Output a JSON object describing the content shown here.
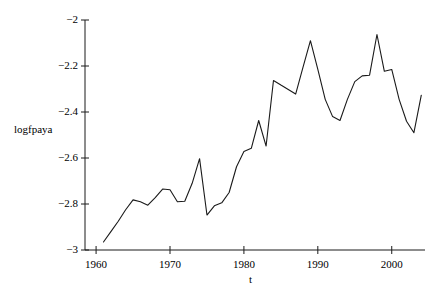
{
  "chart_data": {
    "type": "line",
    "title": "",
    "xlabel": "t",
    "ylabel": "logfpaya",
    "xlim": [
      1958.5,
      2004.5
    ],
    "ylim": [
      -3.02,
      -1.98
    ],
    "grid": false,
    "legend": "none",
    "x_ticks": [
      1960,
      1970,
      1980,
      1990,
      2000
    ],
    "x_tick_labels": [
      "1960",
      "1970",
      "1980",
      "1990",
      "2000"
    ],
    "y_ticks": [
      -2,
      -2.2,
      -2.4,
      -2.6,
      -2.8,
      -3
    ],
    "y_tick_labels": [
      "−2",
      "−2.2",
      "−2.4",
      "−2.6",
      "−2.8",
      "−3"
    ],
    "series": [
      {
        "name": "logfpaya",
        "color": "#1a1a1a",
        "x": [
          1961,
          1962,
          1963,
          1964,
          1965,
          1966,
          1967,
          1968,
          1969,
          1970,
          1971,
          1972,
          1973,
          1974,
          1975,
          1976,
          1977,
          1978,
          1979,
          1980,
          1981,
          1982,
          1983,
          1984,
          1985,
          1986,
          1987,
          1988,
          1989,
          1990,
          1991,
          1992,
          1993,
          1994,
          1995,
          1996,
          1997,
          1998,
          1999,
          2000,
          2001,
          2002,
          2003,
          2004
        ],
        "values": [
          -2.965,
          -2.92,
          -2.875,
          -2.825,
          -2.782,
          -2.79,
          -2.805,
          -2.772,
          -2.735,
          -2.738,
          -2.79,
          -2.788,
          -2.71,
          -2.603,
          -2.848,
          -2.808,
          -2.795,
          -2.75,
          -2.638,
          -2.572,
          -2.558,
          -2.437,
          -2.548,
          -2.263,
          -2.283,
          -2.302,
          -2.322,
          -2.205,
          -2.09,
          -2.215,
          -2.345,
          -2.42,
          -2.437,
          -2.345,
          -2.268,
          -2.243,
          -2.24,
          -2.063,
          -2.223,
          -2.215,
          -2.345,
          -2.44,
          -2.49,
          -2.327
        ]
      }
    ]
  },
  "axis": {
    "y_label": "logfpaya",
    "x_label": "t"
  }
}
